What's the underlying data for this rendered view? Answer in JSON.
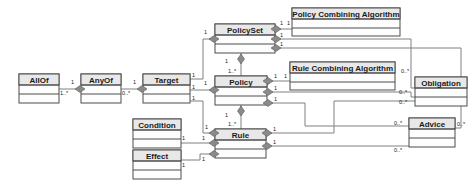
{
  "diagram": {
    "kind": "uml-class-diagram",
    "background_color": "#ffffff",
    "box_fill_color": "#fdfdfd",
    "box_header_color": "#e8e8e8",
    "box_border_color": "#4d4d4d",
    "link_color": "#808080",
    "diamond_color": "#8a8a8a",
    "classes": [
      {
        "id": "allof",
        "label": "AllOf",
        "x": 19,
        "y": 74,
        "w": 40,
        "h": 29,
        "head_h": 11
      },
      {
        "id": "anyof",
        "label": "AnyOf",
        "x": 81,
        "y": 74,
        "w": 40,
        "h": 29,
        "head_h": 11
      },
      {
        "id": "target",
        "label": "Target",
        "x": 143,
        "y": 74,
        "w": 47,
        "h": 29,
        "head_h": 11
      },
      {
        "id": "policyset",
        "label": "PolicySet",
        "x": 215,
        "y": 24,
        "w": 60,
        "h": 29,
        "head_h": 11
      },
      {
        "id": "pca",
        "label": "Policy Combining Algorithm",
        "x": 292,
        "y": 8,
        "w": 108,
        "h": 28,
        "head_h": 11
      },
      {
        "id": "policy",
        "label": "Policy",
        "x": 215,
        "y": 76,
        "w": 52,
        "h": 29,
        "head_h": 11
      },
      {
        "id": "rca",
        "label": "Rule Combining Algorithm",
        "x": 290,
        "y": 62,
        "w": 105,
        "h": 28,
        "head_h": 11
      },
      {
        "id": "obligation",
        "label": "Obligation",
        "x": 415,
        "y": 77,
        "w": 52,
        "h": 29,
        "head_h": 11
      },
      {
        "id": "condition",
        "label": "Condition",
        "x": 133,
        "y": 119,
        "w": 48,
        "h": 29,
        "head_h": 11
      },
      {
        "id": "effect",
        "label": "Effect",
        "x": 133,
        "y": 150,
        "w": 48,
        "h": 29,
        "head_h": 11
      },
      {
        "id": "rule",
        "label": "Rule",
        "x": 215,
        "y": 129,
        "w": 51,
        "h": 29,
        "head_h": 11
      },
      {
        "id": "advice",
        "label": "Advice",
        "x": 409,
        "y": 118,
        "w": 46,
        "h": 29,
        "head_h": 11
      }
    ],
    "associations": [
      {
        "id": "allof-anyof",
        "source": "anyof",
        "target": "allof",
        "source_mult": "1",
        "target_mult": "1..*"
      },
      {
        "id": "anyof-target",
        "source": "target",
        "target": "anyof",
        "source_mult": "1",
        "target_mult": "0..*"
      },
      {
        "id": "target-policyset",
        "source": "policyset",
        "target": "target",
        "source_mult": "1",
        "target_mult": "1"
      },
      {
        "id": "target-policy",
        "source": "policy",
        "target": "target",
        "source_mult": "1",
        "target_mult": "1"
      },
      {
        "id": "target-rule",
        "source": "rule",
        "target": "target",
        "source_mult": "1",
        "target_mult": "1"
      },
      {
        "id": "policyset-policy",
        "source": "policyset",
        "target": "policy",
        "source_mult": "1",
        "target_mult": "1..*"
      },
      {
        "id": "policy-rule",
        "source": "policy",
        "target": "rule",
        "source_mult": "1",
        "target_mult": "1..*"
      },
      {
        "id": "policyset-pca",
        "source": "policyset",
        "target": "pca",
        "source_mult": "1",
        "target_mult": "1"
      },
      {
        "id": "policy-rca",
        "source": "policy",
        "target": "rca",
        "source_mult": "1",
        "target_mult": "1"
      },
      {
        "id": "policyset-obligation",
        "source": "policyset",
        "target": "obligation",
        "source_mult": "1",
        "target_mult": "0..*"
      },
      {
        "id": "policy-obligation",
        "source": "policy",
        "target": "obligation",
        "source_mult": "1",
        "target_mult": "0..*"
      },
      {
        "id": "rule-obligation",
        "source": "rule",
        "target": "obligation",
        "source_mult": "1",
        "target_mult": "0..*"
      },
      {
        "id": "policyset-advice",
        "source": "policyset",
        "target": "advice",
        "source_mult": "1",
        "target_mult": "0..*"
      },
      {
        "id": "policy-advice",
        "source": "policy",
        "target": "advice",
        "source_mult": "1",
        "target_mult": "0..*"
      },
      {
        "id": "rule-advice",
        "source": "rule",
        "target": "advice",
        "source_mult": "1",
        "target_mult": "0..*"
      },
      {
        "id": "condition-rule",
        "source": "rule",
        "target": "condition",
        "source_mult": "1",
        "target_mult": "1"
      },
      {
        "id": "effect-rule",
        "source": "rule",
        "target": "effect",
        "source_mult": "1",
        "target_mult": "1"
      }
    ],
    "labels": {
      "allof": "AllOf",
      "anyof": "AnyOf",
      "target": "Target",
      "policyset": "PolicySet",
      "pca": "Policy Combining Algorithm",
      "policy": "Policy",
      "rca": "Rule Combining Algorithm",
      "obligation": "Obligation",
      "condition": "Condition",
      "effect": "Effect",
      "rule": "Rule",
      "advice": "Advice"
    },
    "multiplicities": {
      "allof_side": "1..*",
      "anyof_left": "1",
      "anyof_right": "0..*",
      "target_left": "1",
      "target_to_policyset": "1",
      "target_to_policy": "1",
      "target_to_rule": "1",
      "policyset_target_end": "1",
      "policy_target_end": "1",
      "rule_target_end": "1",
      "policyset_to_policy": "1",
      "policy_from_policyset": "1..*",
      "policy_to_rule": "1",
      "rule_from_policy": "1..*",
      "policyset_pca_near": "1",
      "pca_near": "1",
      "policy_rca_near": "1",
      "rca_near": "1",
      "policyset_obligation_near": "1",
      "obligation_from_policyset": "0..*",
      "policy_obligation_near": "1",
      "obligation_from_policy": "0..*",
      "rule_obligation_near": "1",
      "obligation_from_rule": "0..*",
      "policyset_advice_near": "1",
      "advice_from_policyset": "0..*",
      "policy_advice_near": "1",
      "advice_from_policy": "0..*",
      "rule_advice_near": "1",
      "advice_from_rule": "0..*",
      "condition_right": "1",
      "condition_rule_end": "1",
      "effect_right": "1",
      "effect_rule_end": "1"
    }
  }
}
